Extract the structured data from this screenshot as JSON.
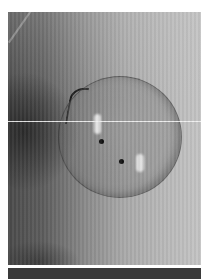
{
  "image": {
    "description": "Grayscale radiographic/microscopy-style image with a circular translucent disc containing two bright highlights and two dark dots",
    "colors": {
      "background": "#ffffff",
      "dark_tone": "#3a3a3a",
      "mid_tone": "#8a8a8a",
      "light_tone": "#c4c4c4",
      "dot": "#111111"
    }
  }
}
